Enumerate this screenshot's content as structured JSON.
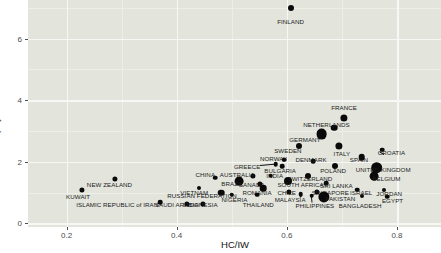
{
  "chart_data": {
    "type": "scatter",
    "title": "",
    "xlabel": "HC/IW",
    "ylabel": "sum.costs.employees/sum.PL.after.tax",
    "xlim": [
      0.13,
      0.88
    ],
    "ylim": [
      -0.12,
      7.25
    ],
    "xticks": [
      0.2,
      0.4,
      0.6,
      0.8
    ],
    "xtick_labels": [
      "0.2",
      "0.4",
      "0.6",
      "0.8"
    ],
    "yticks": [
      0,
      2,
      4,
      6
    ],
    "ytick_labels": [
      "0",
      "2",
      "4",
      "6"
    ],
    "grid": true,
    "legend": "none",
    "point_color": "#0a0a0a",
    "panel_color": "#e3e5dd",
    "grid_color": "#f7f8f5",
    "points": [
      {
        "label": "FINLAND",
        "x": 0.607,
        "y": 7.0,
        "r": 3.0,
        "lx": 0.607,
        "ly": 6.57,
        "anchor": "center"
      },
      {
        "label": "FRANCE",
        "x": 0.704,
        "y": 3.43,
        "r": 3.6,
        "lx": 0.704,
        "ly": 3.78,
        "anchor": "center"
      },
      {
        "label": "NETHERLANDS",
        "x": 0.686,
        "y": 3.1,
        "r": 3.3,
        "lx": 0.672,
        "ly": 3.22,
        "anchor": "center"
      },
      {
        "label": "GERMANY",
        "x": 0.663,
        "y": 2.9,
        "r": 5.4,
        "lx": 0.633,
        "ly": 2.73,
        "anchor": "center"
      },
      {
        "label": "SWEDEN",
        "x": 0.622,
        "y": 2.5,
        "r": 3.0,
        "lx": 0.602,
        "ly": 2.37,
        "anchor": "center"
      },
      {
        "label": "ITALY",
        "x": 0.695,
        "y": 2.52,
        "r": 3.6,
        "lx": 0.7,
        "ly": 2.28,
        "anchor": "center"
      },
      {
        "label": "CROATIA",
        "x": 0.773,
        "y": 2.39,
        "r": 2.3,
        "lx": 0.79,
        "ly": 2.3,
        "anchor": "center"
      },
      {
        "label": "NORWAY",
        "x": 0.595,
        "y": 2.07,
        "r": 2.3,
        "lx": 0.576,
        "ly": 2.13,
        "anchor": "center"
      },
      {
        "label": "DENMARK",
        "x": 0.648,
        "y": 2.02,
        "r": 2.3,
        "lx": 0.644,
        "ly": 2.1,
        "anchor": "center"
      },
      {
        "label": "SPAIN",
        "x": 0.736,
        "y": 2.15,
        "r": 3.3,
        "lx": 0.731,
        "ly": 2.1,
        "anchor": "center"
      },
      {
        "label": "GREECE",
        "x": 0.58,
        "y": 1.92,
        "r": 2.3,
        "lx": 0.528,
        "ly": 1.86,
        "anchor": "center"
      },
      {
        "label": "BULGARIA",
        "x": 0.592,
        "y": 1.85,
        "r": 2.3,
        "lx": 0.588,
        "ly": 1.72,
        "anchor": "center"
      },
      {
        "label": "POLAND",
        "x": 0.687,
        "y": 1.85,
        "r": 3.0,
        "lx": 0.684,
        "ly": 1.72,
        "anchor": "center"
      },
      {
        "label": "UNITED KINGDOM",
        "x": 0.763,
        "y": 1.8,
        "r": 5.8,
        "lx": 0.775,
        "ly": 1.77,
        "anchor": "center"
      },
      {
        "label": "AUSTRALIA",
        "x": 0.539,
        "y": 1.55,
        "r": 2.6,
        "lx": 0.51,
        "ly": 1.61,
        "anchor": "center"
      },
      {
        "label": "INDIA",
        "x": 0.571,
        "y": 1.55,
        "r": 2.3,
        "lx": 0.578,
        "ly": 1.56,
        "anchor": "center"
      },
      {
        "label": "SWITZERLAND",
        "x": 0.639,
        "y": 1.52,
        "r": 3.0,
        "lx": 0.642,
        "ly": 1.48,
        "anchor": "center"
      },
      {
        "label": "BELGIUM",
        "x": 0.759,
        "y": 1.52,
        "r": 4.4,
        "lx": 0.781,
        "ly": 1.48,
        "anchor": "center"
      },
      {
        "label": "CHINA",
        "x": 0.47,
        "y": 1.48,
        "r": 2.3,
        "lx": 0.452,
        "ly": 1.6,
        "anchor": "center"
      },
      {
        "label": "BRAZIL",
        "x": 0.513,
        "y": 1.36,
        "r": 4.4,
        "lx": 0.501,
        "ly": 1.32,
        "anchor": "center"
      },
      {
        "label": "CANADA",
        "x": 0.551,
        "y": 1.29,
        "r": 2.6,
        "lx": 0.536,
        "ly": 1.27,
        "anchor": "center"
      },
      {
        "label": "SOUTH AFRICA",
        "x": 0.603,
        "y": 1.36,
        "r": 4.0,
        "lx": 0.625,
        "ly": 1.28,
        "anchor": "center"
      },
      {
        "label": "SRI LANKA",
        "x": 0.672,
        "y": 1.3,
        "r": 2.3,
        "lx": 0.69,
        "ly": 1.24,
        "anchor": "center"
      },
      {
        "label": "ROMANIA",
        "x": 0.557,
        "y": 1.14,
        "r": 3.3,
        "lx": 0.546,
        "ly": 1.03,
        "anchor": "center"
      },
      {
        "label": "CHILE",
        "x": 0.604,
        "y": 1.03,
        "r": 2.6,
        "lx": 0.6,
        "ly": 1.03,
        "anchor": "center"
      },
      {
        "label": "SINGAPORE",
        "x": 0.655,
        "y": 1.03,
        "r": 2.6,
        "lx": 0.679,
        "ly": 1.03,
        "anchor": "center"
      },
      {
        "label": "ISRAEL",
        "x": 0.728,
        "y": 1.09,
        "r": 2.3,
        "lx": 0.735,
        "ly": 1.03,
        "anchor": "center"
      },
      {
        "label": "JORDAN",
        "x": 0.777,
        "y": 1.09,
        "r": 2.0,
        "lx": 0.786,
        "ly": 1.0,
        "anchor": "center"
      },
      {
        "label": "PAKISTAN",
        "x": 0.668,
        "y": 0.86,
        "r": 5.6,
        "lx": 0.697,
        "ly": 0.83,
        "anchor": "center"
      },
      {
        "label": "EGYPT",
        "x": 0.782,
        "y": 0.87,
        "r": 2.3,
        "lx": 0.792,
        "ly": 0.76,
        "anchor": "center"
      },
      {
        "label": "MALAYSIA",
        "x": 0.625,
        "y": 0.95,
        "r": 2.3,
        "lx": 0.606,
        "ly": 0.78,
        "anchor": "center"
      },
      {
        "label": "PHILIPPINES",
        "x": 0.645,
        "y": 0.89,
        "r": 2.3,
        "lx": 0.651,
        "ly": 0.59,
        "anchor": "center"
      },
      {
        "label": "BANGLADESH",
        "x": 0.736,
        "y": 0.88,
        "r": 2.0,
        "lx": 0.733,
        "ly": 0.59,
        "anchor": "center"
      },
      {
        "label": "NIGERIA",
        "x": 0.5,
        "y": 0.93,
        "r": 2.3,
        "lx": 0.505,
        "ly": 0.8,
        "anchor": "center"
      },
      {
        "label": "THAILAND",
        "x": 0.546,
        "y": 0.93,
        "r": 2.3,
        "lx": 0.548,
        "ly": 0.62,
        "anchor": "center"
      },
      {
        "label": "RUSSIAN FEDERATION",
        "x": 0.481,
        "y": 1.0,
        "r": 3.3,
        "lx": 0.446,
        "ly": 0.93,
        "anchor": "center"
      },
      {
        "label": "VIETNAM",
        "x": 0.441,
        "y": 1.14,
        "r": 2.0,
        "lx": 0.432,
        "ly": 1.02,
        "anchor": "center"
      },
      {
        "label": "INDONESIA",
        "x": 0.448,
        "y": 0.64,
        "r": 2.6,
        "lx": 0.443,
        "ly": 0.62,
        "anchor": "center"
      },
      {
        "label": "SAUDI ARABIA",
        "x": 0.419,
        "y": 0.64,
        "r": 2.6,
        "lx": 0.4,
        "ly": 0.62,
        "anchor": "center"
      },
      {
        "label": "ISLAMIC REPUBLIC of IRAN",
        "x": 0.37,
        "y": 0.68,
        "r": 2.3,
        "lx": 0.292,
        "ly": 0.62,
        "anchor": "center"
      },
      {
        "label": "NEW ZEALAND",
        "x": 0.288,
        "y": 1.45,
        "r": 2.6,
        "lx": 0.278,
        "ly": 1.26,
        "anchor": "center"
      },
      {
        "label": "KUWAIT",
        "x": 0.228,
        "y": 1.08,
        "r": 2.6,
        "lx": 0.221,
        "ly": 0.9,
        "anchor": "center"
      }
    ],
    "leaders": [
      {
        "from_x": 0.552,
        "from_y": 1.88,
        "to_x": 0.578,
        "to_y": 1.92
      },
      {
        "from_x": 0.592,
        "from_y": 2.09,
        "to_x": 0.596,
        "to_y": 2.03
      },
      {
        "from_x": 0.776,
        "from_y": 2.26,
        "to_x": 0.768,
        "to_y": 2.35
      },
      {
        "from_x": 0.646,
        "from_y": 0.68,
        "to_x": 0.645,
        "to_y": 0.86
      },
      {
        "from_x": 0.624,
        "from_y": 0.86,
        "to_x": 0.627,
        "to_y": 0.93
      }
    ]
  }
}
